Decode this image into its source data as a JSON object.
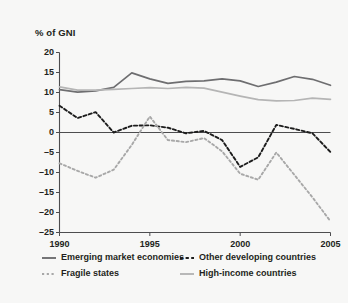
{
  "chart_data": {
    "type": "line",
    "title": "",
    "subtitle": "",
    "xlabel": "",
    "ylabel": "% of GNI",
    "unit_label": "% of GNI",
    "xlim": [
      1990,
      2005
    ],
    "ylim": [
      -25,
      20
    ],
    "grid": false,
    "legend_position": "bottom",
    "zero_line": true,
    "x": [
      1990,
      1991,
      1992,
      1993,
      1994,
      1995,
      1996,
      1997,
      1998,
      1999,
      2000,
      2001,
      2002,
      2003,
      2004,
      2005
    ],
    "xticks": [
      1990,
      1995,
      2000,
      2005
    ],
    "xtick_labels": [
      "1990",
      "1995",
      "2000",
      "2005"
    ],
    "yticks": [
      20,
      15,
      10,
      5,
      0,
      -5,
      -10,
      -15,
      -20,
      -25
    ],
    "ytick_labels": [
      "20",
      "15",
      "10",
      "5",
      "0",
      "–5",
      "–10",
      "–15",
      "–20",
      "–25"
    ],
    "series": [
      {
        "name": "Emerging market economies",
        "style": "solid",
        "color": "#6e6e70",
        "values": [
          10.7,
          10.1,
          10.4,
          11.3,
          14.9,
          13.4,
          12.3,
          12.8,
          12.9,
          13.4,
          12.9,
          11.5,
          12.6,
          14.0,
          13.3,
          11.8
        ]
      },
      {
        "name": "Other developing countries",
        "style": "dashed",
        "color": "#1c1c1c",
        "values": [
          6.7,
          3.6,
          5.1,
          0.0,
          1.7,
          1.8,
          1.2,
          -0.2,
          0.4,
          -1.9,
          -8.6,
          -6.2,
          1.9,
          0.9,
          -0.2,
          -4.9
        ]
      },
      {
        "name": "Fragile states",
        "style": "dotted",
        "color": "#a8a8a8",
        "values": [
          -7.7,
          -9.6,
          -11.3,
          -9.3,
          -3.1,
          4.0,
          -1.9,
          -2.4,
          -1.4,
          -4.7,
          -10.3,
          -11.8,
          -5.0,
          -10.6,
          -16.2,
          -22.2
        ]
      },
      {
        "name": "High-income countries",
        "style": "solid",
        "color": "#b5b5b5",
        "values": [
          11.4,
          10.6,
          10.6,
          10.8,
          11.0,
          11.2,
          11.0,
          11.3,
          11.1,
          10.1,
          9.1,
          8.2,
          7.9,
          8.0,
          8.6,
          8.3
        ]
      }
    ],
    "legend": [
      {
        "label": "Emerging market economies",
        "style": "solid",
        "color": "#6e6e70"
      },
      {
        "label": "Other developing countries",
        "style": "dashed",
        "color": "#1c1c1c"
      },
      {
        "label": "Fragile states",
        "style": "dotted",
        "color": "#a8a8a8"
      },
      {
        "label": "High-income countries",
        "style": "solid",
        "color": "#b5b5b5"
      }
    ]
  },
  "colors": {
    "background": "#f7f7f6",
    "axis": "#4d4d4f",
    "text": "#231f20",
    "emerging": "#6e6e70",
    "other_developing": "#1c1c1c",
    "fragile": "#a8a8a8",
    "high_income": "#b5b5b5"
  }
}
